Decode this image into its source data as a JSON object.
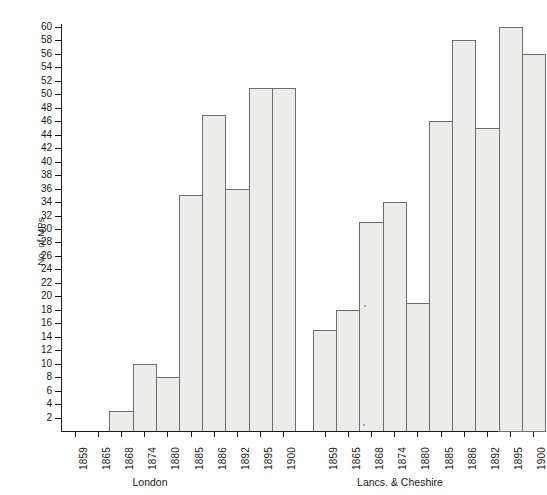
{
  "chart_data": {
    "type": "bar",
    "title": "",
    "subtitle": "",
    "xlabel": "",
    "ylabel": "No. of MPs",
    "ylim": [
      0,
      60
    ],
    "y_tick_step": 2,
    "grid": false,
    "legend": null,
    "categories": [
      "1859",
      "1865",
      "1868",
      "1874",
      "1880",
      "1885",
      "1886",
      "1892",
      "1895",
      "1900"
    ],
    "groups": [
      {
        "name": "London",
        "categories": [
          "1859",
          "1865",
          "1868",
          "1874",
          "1880",
          "1885",
          "1886",
          "1892",
          "1895",
          "1900"
        ],
        "values": [
          0,
          0,
          3,
          10,
          8,
          35,
          47,
          36,
          51,
          51
        ]
      },
      {
        "name": "Lancs. & Cheshire",
        "categories": [
          "1859",
          "1865",
          "1868",
          "1874",
          "1880",
          "1885",
          "1886",
          "1892",
          "1895",
          "1900"
        ],
        "values": [
          15,
          18,
          31,
          34,
          19,
          46,
          58,
          45,
          60,
          56
        ]
      }
    ],
    "series": [
      {
        "name": "London",
        "values": [
          0,
          0,
          3,
          10,
          8,
          35,
          47,
          36,
          51,
          51
        ]
      },
      {
        "name": "Lancs. & Cheshire",
        "values": [
          15,
          18,
          31,
          34,
          19,
          46,
          58,
          45,
          60,
          56
        ]
      }
    ],
    "y_ticks": [
      2,
      4,
      6,
      8,
      10,
      12,
      14,
      16,
      18,
      20,
      22,
      24,
      26,
      28,
      30,
      32,
      34,
      36,
      38,
      40,
      42,
      44,
      46,
      48,
      50,
      52,
      54,
      56,
      58,
      60
    ],
    "colors": {
      "bar_fill": "#ececeb",
      "bar_stroke": "#6d6d6d",
      "axis": "#1a1a1a",
      "text": "#1a1a1a",
      "background": "#ffffff"
    }
  }
}
